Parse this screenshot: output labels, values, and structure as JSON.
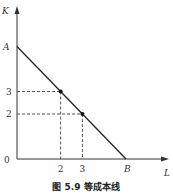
{
  "chart_data": {
    "type": "line",
    "title": "",
    "caption": "图 5.9   等成本线",
    "xlabel": "L",
    "ylabel": "K",
    "origin_label": "0",
    "x_ticks": [
      "2",
      "3"
    ],
    "y_ticks": [
      "2",
      "3"
    ],
    "series": [
      {
        "name": "isocost line",
        "x": [
          0,
          5
        ],
        "y": [
          5,
          0
        ],
        "start_label": "A",
        "end_label": "B"
      }
    ],
    "points": [
      {
        "x": 2,
        "y": 3
      },
      {
        "x": 3,
        "y": 2
      }
    ],
    "xlim": [
      0,
      6.5
    ],
    "ylim": [
      0,
      8
    ],
    "grid": false
  }
}
